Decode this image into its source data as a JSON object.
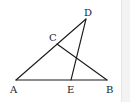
{
  "figure": {
    "points": {
      "A": {
        "label": "A",
        "x": 16,
        "y": 80,
        "label_x": 10,
        "label_y": 93
      },
      "B": {
        "label": "B",
        "x": 107,
        "y": 80,
        "label_x": 106,
        "label_y": 93
      },
      "C": {
        "label": "C",
        "x": 57,
        "y": 44,
        "label_x": 49,
        "label_y": 41
      },
      "D": {
        "label": "D",
        "x": 86,
        "y": 19,
        "label_x": 84,
        "label_y": 16
      },
      "E": {
        "label": "E",
        "x": 71,
        "y": 80,
        "label_x": 67,
        "label_y": 93
      }
    },
    "segments": [
      {
        "from": "A",
        "to": "B"
      },
      {
        "from": "A",
        "to": "D"
      },
      {
        "from": "C",
        "to": "B"
      },
      {
        "from": "D",
        "to": "E"
      }
    ],
    "colors": {
      "line": "#1a1a1a",
      "label": "#222222",
      "background": "#ffffff"
    }
  }
}
